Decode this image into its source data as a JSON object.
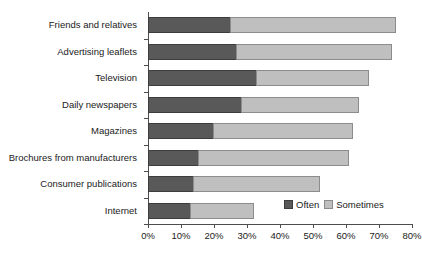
{
  "chart_data": {
    "type": "bar",
    "orientation": "horizontal",
    "stacked": true,
    "title": "",
    "xlabel": "",
    "ylabel": "",
    "xlim": [
      0,
      80
    ],
    "xticks": [
      0,
      10,
      20,
      30,
      40,
      50,
      60,
      70,
      80
    ],
    "xtick_labels": [
      "0%",
      "10%",
      "20%",
      "30%",
      "40%",
      "50%",
      "60%",
      "70%",
      "80%"
    ],
    "grid": false,
    "legend_position": "inside-bottom-right",
    "categories": [
      "Friends and relatives",
      "Advertising leaflets",
      "Television",
      "Daily newspapers",
      "Magazines",
      "Brochures from manufacturers",
      "Consumer publications",
      "Internet"
    ],
    "series": [
      {
        "name": "Often",
        "color": "#595959",
        "values": [
          25,
          27,
          33,
          28.5,
          20,
          15.5,
          14,
          13
        ]
      },
      {
        "name": "Sometimes",
        "color": "#bfbfbf",
        "values": [
          50,
          47,
          34,
          35.5,
          42,
          45.5,
          38,
          19
        ]
      }
    ],
    "totals": [
      75,
      74,
      67,
      64,
      62,
      61,
      52,
      32
    ]
  },
  "legend": {
    "items": [
      {
        "label": "Often",
        "color": "#595959"
      },
      {
        "label": "Sometimes",
        "color": "#bfbfbf"
      }
    ]
  },
  "colors": {
    "often": "#595959",
    "sometimes": "#bfbfbf",
    "axis": "#4d4d4d",
    "text": "#1a1a1a",
    "background": "#ffffff"
  }
}
